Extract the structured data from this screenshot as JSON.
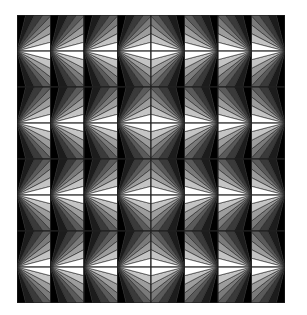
{
  "figure": {
    "type": "optical-illusion-tile-pattern",
    "columns": 8,
    "rows": 4,
    "wedges_per_half": 8,
    "tile_width": 33.5,
    "tile_height": 72,
    "stroke_color": "#222222",
    "gray_levels": [
      "#000000",
      "#1c1c1c",
      "#3a3a3a",
      "#5a5a5a",
      "#7a7a7a",
      "#9c9c9c",
      "#c4c4c4",
      "#ffffff"
    ],
    "column_orientation": [
      "left",
      "left",
      "left",
      "left",
      "right",
      "right",
      "right",
      "right"
    ]
  }
}
